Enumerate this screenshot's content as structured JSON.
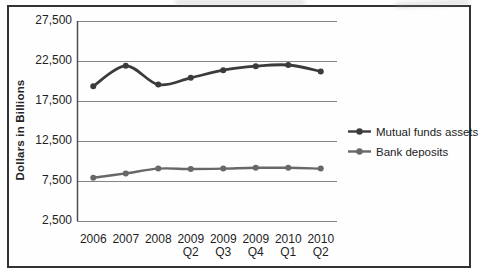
{
  "figure": {
    "background": "#ffffff",
    "border_color": "#333333",
    "grid_color": "#858585",
    "axis_color": "#4d4d4d",
    "text_color": "#1e1e1e"
  },
  "chart_data": {
    "type": "line",
    "title": "",
    "xlabel": "",
    "ylabel": "Dollars in Billions",
    "ylim": [
      2500,
      27500
    ],
    "y_tick_interval": 5000,
    "y_tick_labels": [
      "27,500",
      "22,500",
      "17,500",
      "12,500",
      "7,500",
      "2,500"
    ],
    "categories": [
      "2006",
      "2007",
      "2008",
      "2009 Q2",
      "2009 Q3",
      "2009 Q4",
      "2010 Q1",
      "2010 Q2"
    ],
    "category_lines": [
      [
        "2006",
        ""
      ],
      [
        "2007",
        ""
      ],
      [
        "2008",
        ""
      ],
      [
        "2009",
        "Q2"
      ],
      [
        "2009",
        "Q3"
      ],
      [
        "2009",
        "Q4"
      ],
      [
        "2010",
        "Q1"
      ],
      [
        "2010",
        "Q2"
      ]
    ],
    "grid": "horizontal",
    "legend_position": "right",
    "series": [
      {
        "name": "Mutual funds assets",
        "color": "#3b3b3b",
        "marker": "circle",
        "values": [
          19350,
          21900,
          19550,
          20400,
          21350,
          21850,
          22000,
          21200
        ]
      },
      {
        "name": "Bank deposits",
        "color": "#686868",
        "marker": "circle",
        "values": [
          7900,
          8450,
          9050,
          9000,
          9050,
          9150,
          9150,
          9050
        ]
      }
    ]
  }
}
